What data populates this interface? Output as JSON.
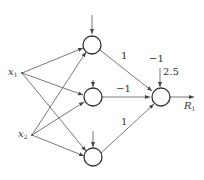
{
  "diagram": {
    "type": "neural-network",
    "colors": {
      "stroke": "#444444",
      "text": "#333333",
      "background": "#ffffff"
    },
    "inputs": [
      {
        "id": "x1",
        "label": "x",
        "sub": "1"
      },
      {
        "id": "x2",
        "label": "x",
        "sub": "2"
      }
    ],
    "hidden_nodes": [
      "h1",
      "h2",
      "h3"
    ],
    "output": {
      "id": "out",
      "label": "R",
      "sub": "1"
    },
    "weights": {
      "h1_out": "1",
      "h2_out": "−1",
      "h3_out": "1"
    },
    "output_bias": {
      "weight": "−1",
      "value": "2.5"
    }
  }
}
